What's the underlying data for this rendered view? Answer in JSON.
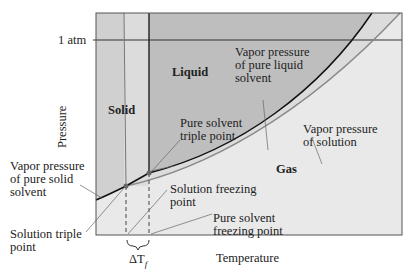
{
  "diagram": {
    "axes": {
      "x_label": "Temperature",
      "y_label": "Pressure",
      "y_tick": "1 atm"
    },
    "regions": {
      "solid": "Solid",
      "liquid": "Liquid",
      "gas": "Gas"
    },
    "annotations": {
      "vp_pure_liquid": [
        "Vapor pressure",
        "of pure liquid",
        "solvent"
      ],
      "vp_solution": [
        "Vapor pressure",
        "of solution"
      ],
      "pure_triple": [
        "Pure solvent",
        "triple point"
      ],
      "vp_pure_solid": [
        "Vapor pressure",
        "of pure solid",
        "solvent"
      ],
      "solution_freezing": [
        "Solution freezing",
        "point"
      ],
      "solution_triple": [
        "Solution triple",
        "point"
      ],
      "pure_freezing": [
        "Pure solvent",
        "freezing point"
      ],
      "delta_tf": "ΔT",
      "delta_tf_sub": "f"
    },
    "colors": {
      "solid_region": "#cfcfcf",
      "liquid_region": "#bdbdbd",
      "gas_region": "#e8e8e8",
      "band_region": "#dadada",
      "pure_curve": "#111111",
      "solution_curve": "#8a8a8a",
      "frame": "#555555"
    }
  }
}
